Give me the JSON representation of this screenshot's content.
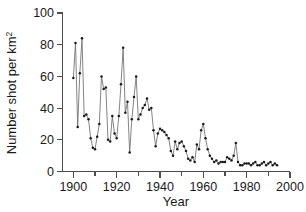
{
  "chart_data": {
    "type": "line",
    "title": "",
    "subtitle": "",
    "xlabel": "Year",
    "ylabel": "Number shot per km",
    "ylabel_superscript": "2",
    "ylabel_full": "Number shot per km2",
    "xlim": [
      1895,
      2000
    ],
    "ylim": [
      0,
      100
    ],
    "xticks": [
      1900,
      1920,
      1940,
      1960,
      1980,
      2000
    ],
    "xtick_labels": [
      "1900",
      "1920",
      "1940",
      "1960",
      "1980",
      "2000"
    ],
    "xticks_minor": [
      1910,
      1930,
      1950,
      1970,
      1990
    ],
    "yticks": [
      0,
      20,
      40,
      60,
      80,
      100
    ],
    "ytick_labels": [
      "0",
      "20",
      "40",
      "60",
      "80",
      "100"
    ],
    "grid": false,
    "legend": false,
    "legend_position": "none",
    "marker": "filled-circle",
    "line_color": "#6e6e6e",
    "marker_color": "#1a1a1a",
    "axis_color": "#4d4d4d",
    "series": [
      {
        "name": "Number shot per km2",
        "x": [
          1900,
          1901,
          1902,
          1903,
          1904,
          1905,
          1906,
          1907,
          1908,
          1909,
          1910,
          1911,
          1912,
          1913,
          1914,
          1915,
          1916,
          1917,
          1918,
          1919,
          1920,
          1921,
          1922,
          1923,
          1924,
          1925,
          1926,
          1927,
          1928,
          1929,
          1930,
          1931,
          1932,
          1933,
          1934,
          1935,
          1936,
          1937,
          1938,
          1939,
          1940,
          1941,
          1942,
          1943,
          1944,
          1945,
          1946,
          1947,
          1948,
          1949,
          1950,
          1951,
          1952,
          1953,
          1954,
          1955,
          1956,
          1957,
          1958,
          1959,
          1960,
          1961,
          1962,
          1963,
          1964,
          1965,
          1966,
          1967,
          1968,
          1969,
          1970,
          1971,
          1972,
          1973,
          1974,
          1975,
          1976,
          1977,
          1978,
          1979,
          1980,
          1981,
          1982,
          1983,
          1984,
          1985,
          1986,
          1987,
          1988,
          1989,
          1990,
          1991,
          1992,
          1993,
          1994
        ],
        "values": [
          59,
          81,
          28,
          62,
          84,
          35,
          36,
          33,
          21,
          15,
          14,
          22,
          30,
          60,
          52,
          53,
          20,
          19,
          35,
          24,
          21,
          35,
          55,
          78,
          37,
          44,
          12,
          33,
          47,
          60,
          33,
          36,
          40,
          42,
          46,
          39,
          40,
          26,
          16,
          24,
          27,
          26,
          25,
          23,
          21,
          13,
          10,
          19,
          14,
          18,
          19,
          16,
          13,
          8,
          7,
          9,
          6,
          17,
          14,
          26,
          30,
          21,
          14,
          10,
          8,
          6,
          7,
          5,
          6,
          6,
          6,
          9,
          8,
          7,
          10,
          18,
          6,
          4,
          4,
          5,
          5,
          5,
          4,
          5,
          6,
          4,
          4,
          5,
          6,
          4,
          5,
          6,
          4,
          5,
          4
        ]
      }
    ]
  }
}
